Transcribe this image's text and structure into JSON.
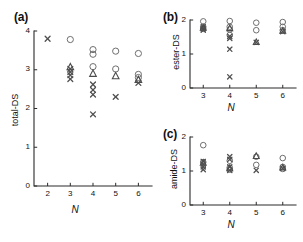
{
  "figure": {
    "background": "#ffffff",
    "marker_colors": {
      "circle": "#6f6f6f",
      "triangle": "#4a4a4a",
      "cross": "#4f4f4f",
      "axis": "#2b2b2b"
    }
  },
  "panels": {
    "a": {
      "label": "(a)",
      "ylabel": "total-DS",
      "xlabel": "N",
      "yticks": [
        "0",
        "1",
        "2",
        "3",
        "4"
      ],
      "xticks": [
        "2",
        "3",
        "4",
        "5",
        "6"
      ]
    },
    "b": {
      "label": "(b)",
      "ylabel": "ester-DS",
      "xlabel": "N",
      "yticks": [
        "0",
        "1",
        "2"
      ],
      "xticks": [
        "3",
        "4",
        "5",
        "6"
      ]
    },
    "c": {
      "label": "(c)",
      "ylabel": "amide-DS",
      "xlabel": "N",
      "yticks": [
        "0",
        "1",
        "2"
      ],
      "xticks": [
        "3",
        "4",
        "5",
        "6"
      ]
    }
  },
  "chart_data": [
    {
      "type": "scatter",
      "panel": "a",
      "title": "(a)",
      "xlabel": "N",
      "ylabel": "total-DS",
      "xlim": [
        1.4,
        6.6
      ],
      "ylim": [
        0,
        4
      ],
      "xticks": [
        2,
        3,
        4,
        5,
        6
      ],
      "yticks": [
        0,
        1,
        2,
        3,
        4
      ],
      "grid": false,
      "legend": "none",
      "series": [
        {
          "name": "circle",
          "marker": "circle",
          "points": [
            {
              "x": 3,
              "y": 3.78
            },
            {
              "x": 4,
              "y": 3.52
            },
            {
              "x": 4,
              "y": 3.4
            },
            {
              "x": 4,
              "y": 3.08
            },
            {
              "x": 5,
              "y": 3.48
            },
            {
              "x": 5,
              "y": 3.02
            },
            {
              "x": 6,
              "y": 3.42
            },
            {
              "x": 6,
              "y": 2.88
            },
            {
              "x": 6,
              "y": 2.8
            }
          ]
        },
        {
          "name": "triangle",
          "marker": "triangle",
          "points": [
            {
              "x": 3,
              "y": 3.07
            },
            {
              "x": 4,
              "y": 2.9
            },
            {
              "x": 5,
              "y": 2.84
            },
            {
              "x": 6,
              "y": 2.74
            }
          ]
        },
        {
          "name": "cross",
          "marker": "cross",
          "points": [
            {
              "x": 2,
              "y": 3.8
            },
            {
              "x": 3,
              "y": 3.02
            },
            {
              "x": 3,
              "y": 2.94
            },
            {
              "x": 3,
              "y": 2.86
            },
            {
              "x": 3,
              "y": 2.76
            },
            {
              "x": 4,
              "y": 2.62
            },
            {
              "x": 4,
              "y": 2.48
            },
            {
              "x": 4,
              "y": 2.36
            },
            {
              "x": 4,
              "y": 1.85
            },
            {
              "x": 5,
              "y": 2.3
            },
            {
              "x": 6,
              "y": 2.66
            }
          ]
        }
      ]
    },
    {
      "type": "scatter",
      "panel": "b",
      "title": "(b)",
      "xlabel": "N",
      "ylabel": "ester-DS",
      "xlim": [
        2.5,
        6.5
      ],
      "ylim": [
        0,
        2
      ],
      "xticks": [
        3,
        4,
        5,
        6
      ],
      "yticks": [
        0,
        1,
        2
      ],
      "grid": false,
      "legend": "none",
      "series": [
        {
          "name": "circle",
          "marker": "circle",
          "points": [
            {
              "x": 3,
              "y": 1.96
            },
            {
              "x": 3,
              "y": 1.8
            },
            {
              "x": 3,
              "y": 1.74
            },
            {
              "x": 4,
              "y": 1.97
            },
            {
              "x": 4,
              "y": 1.8
            },
            {
              "x": 4,
              "y": 1.72
            },
            {
              "x": 4,
              "y": 1.56
            },
            {
              "x": 5,
              "y": 1.92
            },
            {
              "x": 5,
              "y": 1.7
            },
            {
              "x": 6,
              "y": 1.94
            },
            {
              "x": 6,
              "y": 1.8
            },
            {
              "x": 6,
              "y": 1.7
            }
          ]
        },
        {
          "name": "triangle",
          "marker": "triangle",
          "points": [
            {
              "x": 3,
              "y": 1.77
            },
            {
              "x": 4,
              "y": 1.76
            },
            {
              "x": 5,
              "y": 1.35
            },
            {
              "x": 6,
              "y": 1.68
            }
          ]
        },
        {
          "name": "cross",
          "marker": "cross",
          "points": [
            {
              "x": 3,
              "y": 1.8
            },
            {
              "x": 3,
              "y": 1.74
            },
            {
              "x": 3,
              "y": 1.7
            },
            {
              "x": 4,
              "y": 1.52
            },
            {
              "x": 4,
              "y": 1.46
            },
            {
              "x": 4,
              "y": 1.14
            },
            {
              "x": 4,
              "y": 0.33
            },
            {
              "x": 5,
              "y": 1.34
            },
            {
              "x": 6,
              "y": 1.66
            }
          ]
        }
      ]
    },
    {
      "type": "scatter",
      "panel": "c",
      "title": "(c)",
      "xlabel": "N",
      "ylabel": "amide-DS",
      "xlim": [
        2.5,
        6.5
      ],
      "ylim": [
        0,
        2
      ],
      "xticks": [
        3,
        4,
        5,
        6
      ],
      "yticks": [
        0,
        1,
        2
      ],
      "grid": false,
      "legend": "none",
      "series": [
        {
          "name": "circle",
          "marker": "circle",
          "points": [
            {
              "x": 3,
              "y": 1.76
            },
            {
              "x": 3,
              "y": 1.26
            },
            {
              "x": 4,
              "y": 1.3
            },
            {
              "x": 4,
              "y": 1.1
            },
            {
              "x": 4,
              "y": 1.04
            },
            {
              "x": 5,
              "y": 1.42
            },
            {
              "x": 5,
              "y": 1.18
            },
            {
              "x": 6,
              "y": 1.38
            },
            {
              "x": 6,
              "y": 1.12
            },
            {
              "x": 6,
              "y": 1.06
            }
          ]
        },
        {
          "name": "triangle",
          "marker": "triangle",
          "points": [
            {
              "x": 3,
              "y": 1.24
            },
            {
              "x": 4,
              "y": 1.08
            },
            {
              "x": 5,
              "y": 1.44
            },
            {
              "x": 6,
              "y": 1.1
            }
          ]
        },
        {
          "name": "cross",
          "marker": "cross",
          "points": [
            {
              "x": 3,
              "y": 1.28
            },
            {
              "x": 3,
              "y": 1.2
            },
            {
              "x": 3,
              "y": 1.12
            },
            {
              "x": 3,
              "y": 1.04
            },
            {
              "x": 4,
              "y": 1.42
            },
            {
              "x": 4,
              "y": 1.34
            },
            {
              "x": 4,
              "y": 1.12
            },
            {
              "x": 4,
              "y": 1.02
            },
            {
              "x": 5,
              "y": 1.02
            },
            {
              "x": 6,
              "y": 1.08
            }
          ]
        }
      ]
    }
  ]
}
